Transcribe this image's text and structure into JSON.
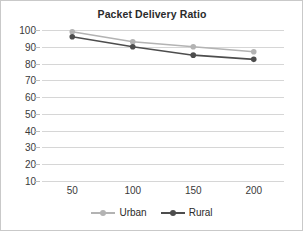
{
  "chart_data": {
    "type": "line",
    "title": "Packet Delivery Ratio",
    "xlabel": "",
    "ylabel": "",
    "x": [
      50,
      100,
      150,
      200
    ],
    "categories": [
      "50",
      "100",
      "150",
      "200"
    ],
    "series": [
      {
        "name": "Urban",
        "values": [
          99,
          93,
          90,
          87
        ],
        "color": "#b3b3b3"
      },
      {
        "name": "Rural",
        "values": [
          96,
          90,
          85,
          82.5
        ],
        "color": "#4d4d4d"
      }
    ],
    "ylim": [
      10,
      100
    ],
    "yticks": [
      100,
      90,
      80,
      70,
      60,
      50,
      40,
      30,
      20,
      10
    ],
    "ytick_labels": [
      "100",
      "90",
      "80",
      "70",
      "60",
      "50",
      "40",
      "30",
      "20",
      "10"
    ],
    "xtick_labels": [
      "50",
      "100",
      "150",
      "200"
    ],
    "grid": true,
    "grid_color": "#d6d6d6",
    "legend_position": "bottom",
    "legend": [
      "Urban",
      "Rural"
    ],
    "background": "#ffffff",
    "border_color": "#c9c9c9"
  }
}
